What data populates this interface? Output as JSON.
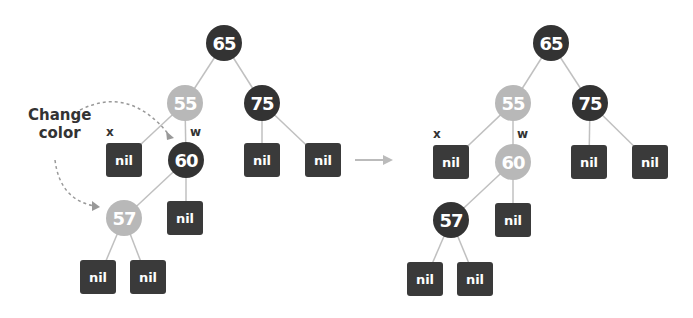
{
  "diagram": {
    "annotation": "Change color",
    "annotation_lines": [
      "Change",
      "color"
    ],
    "colors": {
      "black": "#333333",
      "red": "#b8b8b8",
      "nil": "#3a3a3a",
      "edge": "#c0c0c0",
      "arrow": "#bbbbbb"
    },
    "before": {
      "nodes": [
        {
          "id": "b65",
          "value": "65",
          "color": "black"
        },
        {
          "id": "b55",
          "value": "55",
          "color": "red"
        },
        {
          "id": "b75",
          "value": "75",
          "color": "black"
        },
        {
          "id": "b60",
          "value": "60",
          "color": "black"
        },
        {
          "id": "b57",
          "value": "57",
          "color": "red"
        }
      ],
      "labels": {
        "x": "x",
        "w": "w"
      },
      "nil": "nil"
    },
    "after": {
      "nodes": [
        {
          "id": "a65",
          "value": "65",
          "color": "black"
        },
        {
          "id": "a55",
          "value": "55",
          "color": "red"
        },
        {
          "id": "a75",
          "value": "75",
          "color": "black"
        },
        {
          "id": "a60",
          "value": "60",
          "color": "red"
        },
        {
          "id": "a57",
          "value": "57",
          "color": "black"
        }
      ],
      "labels": {
        "x": "x",
        "w": "w"
      },
      "nil": "nil"
    }
  }
}
